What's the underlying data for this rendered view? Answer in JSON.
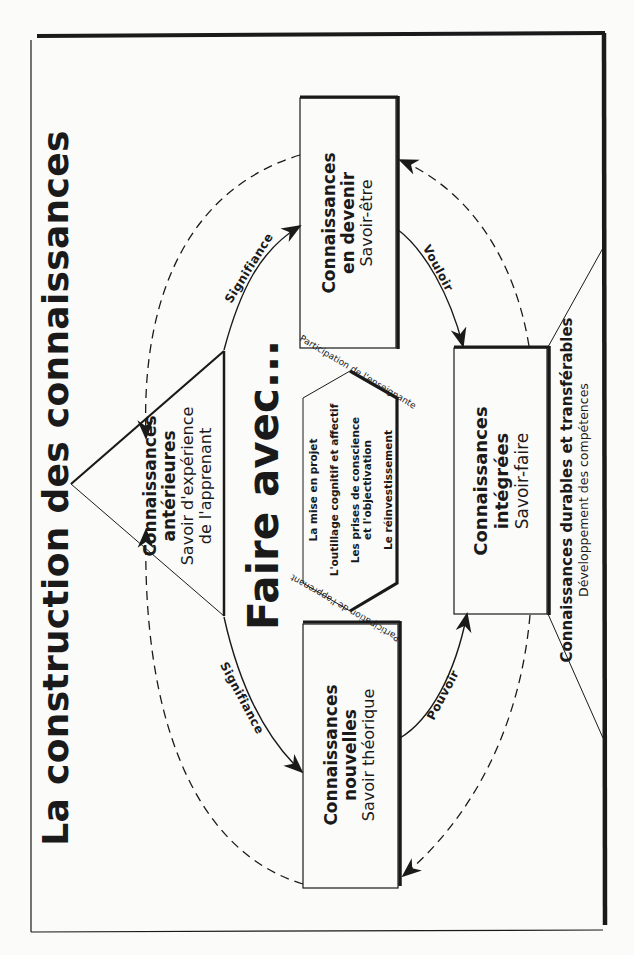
{
  "title": "La construction des connaissances",
  "center": {
    "label": "Faire avec...",
    "hexagon_items": [
      "La mise en projet",
      "L'outillage cognitif et affectif",
      "Les prises de conscience\net l'objectivation",
      "Le réinvestissement"
    ],
    "participation_top": "Participation de l'enseignante",
    "participation_bottom": "Participation de l'apprenant"
  },
  "nodes": {
    "anterieures": {
      "title": "Connaissances\nantérieures",
      "subtitle": "Savoir d'expérience\nde l'apprenant"
    },
    "devenir": {
      "title": "Connaissances\nen devenir",
      "subtitle": "Savoir-être"
    },
    "nouvelles": {
      "title": "Connaissances\nnouvelles",
      "subtitle": "Savoir théorique"
    },
    "integrees": {
      "title": "Connaissances\nintégrées",
      "subtitle": "Savoir-faire"
    },
    "durables": {
      "title": "Connaissances durables et transférables",
      "subtitle": "Développement des compétences"
    }
  },
  "edges": {
    "signifiance_top": "Signifiance",
    "signifiance_bottom": "Signifiance",
    "vouloir": "Vouloir",
    "pouvoir": "Pouvoir"
  },
  "colors": {
    "ink": "#1a1a1a",
    "paper": "#fbfbfa"
  }
}
